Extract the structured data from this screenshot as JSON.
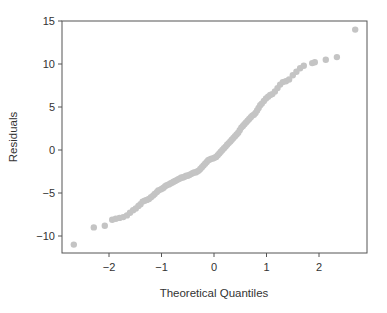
{
  "chart_data": {
    "type": "scatter",
    "title": "",
    "xlabel": "Theoretical Quantiles",
    "ylabel": "Residuals",
    "xlim": [
      -2.92,
      2.9
    ],
    "ylim": [
      -12.0,
      15.1
    ],
    "xticks": [
      -2,
      -1,
      0,
      1,
      2
    ],
    "xtick_labels": [
      "−2",
      "−1",
      "0",
      "1",
      "2"
    ],
    "yticks": [
      -10,
      -5,
      0,
      5,
      10,
      15
    ],
    "ytick_labels": [
      "−10",
      "−5",
      "0",
      "5",
      "10",
      "15"
    ],
    "grid": false,
    "legend": null,
    "marker_color": "#c4c4c4",
    "axis_color": "#555555",
    "points": [
      [
        -2.67,
        -11.0
      ],
      [
        -2.29,
        -9.0
      ],
      [
        -2.08,
        -8.8
      ],
      [
        -1.94,
        -8.1
      ],
      [
        -1.87,
        -8.0
      ],
      [
        -1.8,
        -7.9
      ],
      [
        -1.73,
        -7.8
      ],
      [
        -1.66,
        -7.6
      ],
      [
        -1.6,
        -7.3
      ],
      [
        -1.54,
        -7.0
      ],
      [
        -1.49,
        -6.8
      ],
      [
        -1.44,
        -6.5
      ],
      [
        -1.4,
        -6.3
      ],
      [
        -1.36,
        -6.0
      ],
      [
        -1.32,
        -5.9
      ],
      [
        -1.28,
        -5.8
      ],
      [
        -1.24,
        -5.7
      ],
      [
        -1.2,
        -5.5
      ],
      [
        -1.16,
        -5.3
      ],
      [
        -1.13,
        -5.1
      ],
      [
        -1.09,
        -4.9
      ],
      [
        -1.06,
        -4.7
      ],
      [
        -1.02,
        -4.6
      ],
      [
        -0.99,
        -4.5
      ],
      [
        -0.96,
        -4.4
      ],
      [
        -0.93,
        -4.2
      ],
      [
        -0.9,
        -4.1
      ],
      [
        -0.86,
        -4.0
      ],
      [
        -0.83,
        -3.9
      ],
      [
        -0.8,
        -3.8
      ],
      [
        -0.77,
        -3.7
      ],
      [
        -0.74,
        -3.6
      ],
      [
        -0.71,
        -3.5
      ],
      [
        -0.68,
        -3.4
      ],
      [
        -0.65,
        -3.3
      ],
      [
        -0.62,
        -3.2
      ],
      [
        -0.59,
        -3.2
      ],
      [
        -0.56,
        -3.1
      ],
      [
        -0.53,
        -3.0
      ],
      [
        -0.5,
        -3.0
      ],
      [
        -0.47,
        -2.9
      ],
      [
        -0.44,
        -2.8
      ],
      [
        -0.41,
        -2.7
      ],
      [
        -0.38,
        -2.6
      ],
      [
        -0.35,
        -2.6
      ],
      [
        -0.32,
        -2.5
      ],
      [
        -0.29,
        -2.4
      ],
      [
        -0.26,
        -2.2
      ],
      [
        -0.23,
        -2.0
      ],
      [
        -0.2,
        -1.8
      ],
      [
        -0.17,
        -1.6
      ],
      [
        -0.14,
        -1.4
      ],
      [
        -0.11,
        -1.2
      ],
      [
        -0.08,
        -1.1
      ],
      [
        -0.05,
        -1.0
      ],
      [
        -0.02,
        -1.0
      ],
      [
        0.01,
        -0.9
      ],
      [
        0.04,
        -0.8
      ],
      [
        0.07,
        -0.6
      ],
      [
        0.1,
        -0.4
      ],
      [
        0.13,
        -0.2
      ],
      [
        0.16,
        0.0
      ],
      [
        0.19,
        0.2
      ],
      [
        0.22,
        0.4
      ],
      [
        0.25,
        0.6
      ],
      [
        0.28,
        0.8
      ],
      [
        0.31,
        1.0
      ],
      [
        0.34,
        1.2
      ],
      [
        0.37,
        1.4
      ],
      [
        0.4,
        1.6
      ],
      [
        0.43,
        1.8
      ],
      [
        0.46,
        2.0
      ],
      [
        0.49,
        2.3
      ],
      [
        0.52,
        2.6
      ],
      [
        0.55,
        2.8
      ],
      [
        0.58,
        3.0
      ],
      [
        0.61,
        3.2
      ],
      [
        0.64,
        3.4
      ],
      [
        0.67,
        3.6
      ],
      [
        0.7,
        3.8
      ],
      [
        0.73,
        4.0
      ],
      [
        0.76,
        4.1
      ],
      [
        0.79,
        4.3
      ],
      [
        0.82,
        4.6
      ],
      [
        0.85,
        4.9
      ],
      [
        0.88,
        5.2
      ],
      [
        0.91,
        5.4
      ],
      [
        0.95,
        5.7
      ],
      [
        0.99,
        6.0
      ],
      [
        1.03,
        6.2
      ],
      [
        1.07,
        6.4
      ],
      [
        1.11,
        6.5
      ],
      [
        1.16,
        6.8
      ],
      [
        1.21,
        7.2
      ],
      [
        1.26,
        7.6
      ],
      [
        1.31,
        7.9
      ],
      [
        1.37,
        8.0
      ],
      [
        1.43,
        8.2
      ],
      [
        1.5,
        8.7
      ],
      [
        1.57,
        9.1
      ],
      [
        1.64,
        9.5
      ],
      [
        1.71,
        9.8
      ],
      [
        1.87,
        10.1
      ],
      [
        1.92,
        10.2
      ],
      [
        2.13,
        10.5
      ],
      [
        2.34,
        10.8
      ],
      [
        2.69,
        14.0
      ]
    ]
  }
}
